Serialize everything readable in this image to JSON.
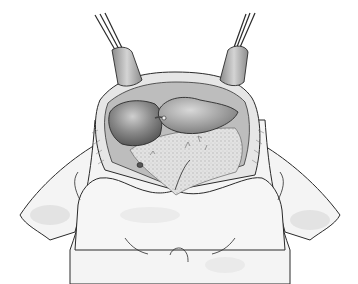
{
  "figure": {
    "alt": "Grayscale surgical illustration of an opened thoracic cavity held by two retractors",
    "background": "#ffffff",
    "colors": {
      "outline": "#2a2a2a",
      "skin": "#f2f2f2",
      "skin_shade": "#d6d6d6",
      "cavity": "#c8c8c8",
      "organ_dark": "#6e6e6e",
      "organ_mid": "#9a9a9a",
      "organ_light": "#bdbdbd",
      "tissue": "#dcdcdc",
      "retractor": "#a8a8a8",
      "retractor_light": "#d0d0d0"
    }
  }
}
